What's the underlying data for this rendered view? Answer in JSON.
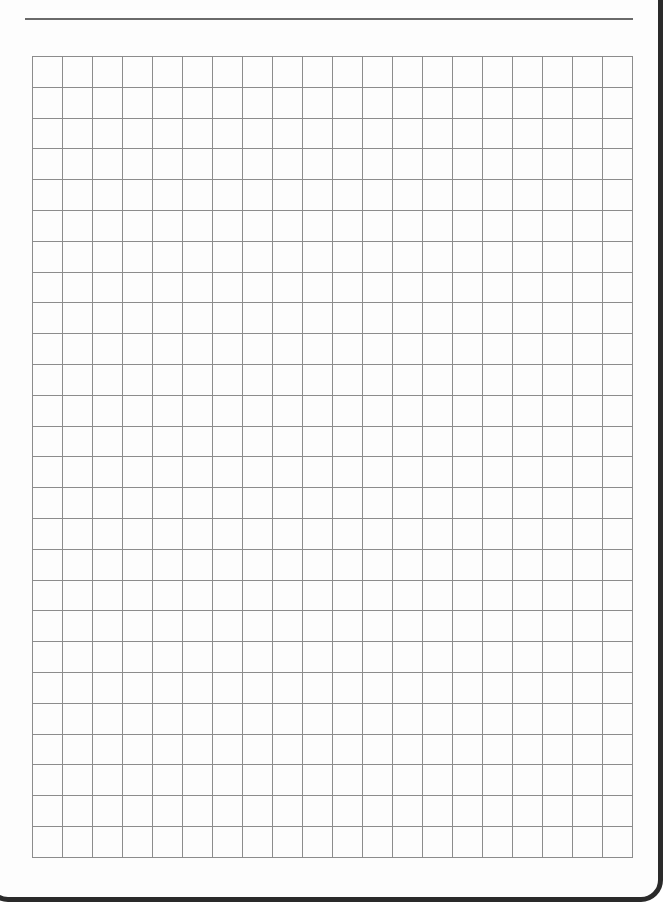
{
  "document": {
    "type": "graph-paper",
    "grid": {
      "columns": 20,
      "rows": 26,
      "cell_width_px": 30,
      "cell_height_px": 30.8,
      "line_color": "#8c8c8c"
    },
    "header_rule_color": "#6a6a6a",
    "border_color": "#2a2a2a",
    "background": "#fdfdfd"
  }
}
